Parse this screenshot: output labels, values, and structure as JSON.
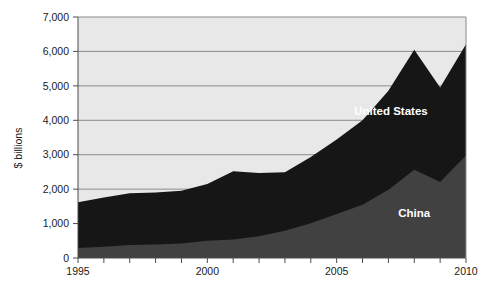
{
  "chart_data": {
    "type": "area",
    "stacked": true,
    "title": "",
    "subtitle": "",
    "xlabel": "",
    "ylabel": "$ billions",
    "xlim": [
      1995,
      2010
    ],
    "ylim": [
      0,
      7000
    ],
    "grid": true,
    "grid_axis": "y",
    "legend_position": "inline-annotation",
    "x": [
      1995,
      1996,
      1997,
      1998,
      1999,
      2000,
      2001,
      2002,
      2003,
      2004,
      2005,
      2006,
      2007,
      2008,
      2009,
      2010
    ],
    "x_tick_labels": [
      "1995",
      "",
      "",
      "",
      "",
      "2000",
      "",
      "",
      "",
      "",
      "2005",
      "",
      "",
      "",
      "",
      "2010"
    ],
    "y_ticks": [
      0,
      1000,
      2000,
      3000,
      4000,
      5000,
      6000,
      7000
    ],
    "y_tick_labels": [
      "0",
      "1,000",
      "2,000",
      "3,000",
      "4,000",
      "5,000",
      "6,000",
      "7,000"
    ],
    "series": [
      {
        "name": "China",
        "label": "China",
        "color": "#414141",
        "label_color": "#ffffff",
        "values": [
          290,
          330,
          380,
          390,
          420,
          500,
          540,
          630,
          790,
          1010,
          1280,
          1550,
          1980,
          2560,
          2210,
          2980
        ]
      },
      {
        "name": "United States",
        "label": "United States",
        "color": "#161616",
        "label_color": "#ffffff",
        "values": [
          1330,
          1430,
          1500,
          1510,
          1530,
          1650,
          1980,
          1840,
          1700,
          1920,
          2160,
          2450,
          2880,
          3490,
          2740,
          3230
        ]
      }
    ],
    "totals": [
      1620,
      1760,
      1880,
      1900,
      1950,
      2150,
      2520,
      2470,
      2490,
      2930,
      3440,
      4000,
      4860,
      6050,
      4950,
      6210
    ],
    "plot_background": "#e8e8e8",
    "gridline_color": "#8c8c8c",
    "axis_color": "#4d4d4d"
  },
  "annotations": {
    "united_states": {
      "text": "United States",
      "x": 2007.1,
      "y": 4150
    },
    "china": {
      "text": "China",
      "x": 2008.0,
      "y": 1180
    }
  }
}
